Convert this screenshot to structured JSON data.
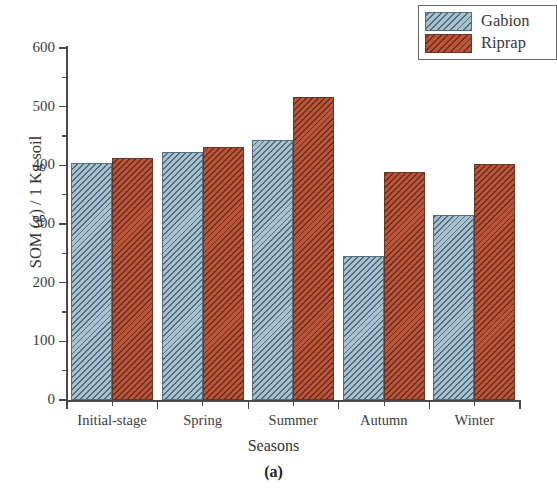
{
  "chart_data": {
    "type": "bar",
    "title": "",
    "caption": "(a)",
    "xlabel": "Seasons",
    "ylabel": "SOM (g) / 1 Kg soil",
    "categories": [
      "Initial-stage",
      "Spring",
      "Summer",
      "Autumn",
      "Winter"
    ],
    "series": [
      {
        "name": "Gabion",
        "color": "#a9c1cd",
        "hatch": "diagonal",
        "values": [
          404,
          422,
          444,
          245,
          315
        ]
      },
      {
        "name": "Riprap",
        "color": "#b8553a",
        "hatch": "diagonal",
        "values": [
          413,
          432,
          517,
          388,
          402
        ]
      }
    ],
    "ylim": [
      0,
      600
    ],
    "ytick_labels": [
      "0",
      "100",
      "200",
      "300",
      "400",
      "500",
      "600"
    ],
    "ytick_values": [
      0,
      100,
      200,
      300,
      400,
      500,
      600
    ],
    "yminor_values": [
      50,
      150,
      250,
      350,
      450,
      550
    ],
    "grid": false,
    "legend_position": "top-right",
    "legend_entries": [
      "Gabion",
      "Riprap"
    ]
  }
}
